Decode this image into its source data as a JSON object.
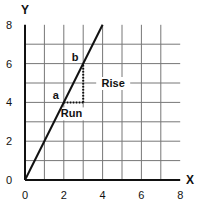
{
  "chart_data": {
    "type": "line",
    "title": "",
    "xlabel": "X",
    "ylabel": "Y",
    "xlim": [
      0,
      8
    ],
    "ylim": [
      0,
      8
    ],
    "grid": true,
    "x_ticks": [
      0,
      2,
      4,
      6,
      8
    ],
    "y_ticks": [
      0,
      2,
      4,
      6,
      8
    ],
    "series": [
      {
        "name": "line",
        "x": [
          0,
          4
        ],
        "y": [
          0,
          8
        ],
        "slope": 2
      }
    ],
    "points": [
      {
        "label": "a",
        "x": 2,
        "y": 4
      },
      {
        "label": "b",
        "x": 3,
        "y": 6
      }
    ],
    "annotations": [
      {
        "text": "Run",
        "from": [
          2,
          4
        ],
        "to": [
          3,
          4
        ],
        "style": "dotted"
      },
      {
        "text": "Rise",
        "from": [
          3,
          4
        ],
        "to": [
          3,
          6
        ],
        "style": "dotted"
      }
    ]
  },
  "colors": {
    "line": "#111111",
    "grid": "#777777",
    "axis": "#111111",
    "background": "#ffffff"
  }
}
